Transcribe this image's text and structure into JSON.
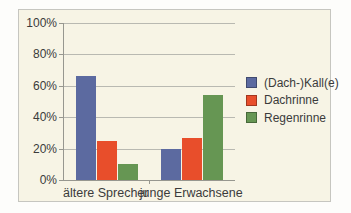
{
  "chart_data": {
    "type": "bar",
    "title": "",
    "xlabel": "",
    "ylabel": "",
    "categories": [
      "ältere Sprecher",
      "junge Erwachsene"
    ],
    "series": [
      {
        "name": "(Dach-)Kall(e)",
        "color": "#5c6aa0",
        "values": [
          66,
          20
        ]
      },
      {
        "name": "Dachrinne",
        "color": "#e84e2b",
        "values": [
          25,
          27
        ]
      },
      {
        "name": "Regenrinne",
        "color": "#669653",
        "values": [
          10,
          54
        ]
      }
    ],
    "y_ticks": [
      "0%",
      "20%",
      "40%",
      "60%",
      "80%",
      "100%"
    ],
    "ylim": [
      0,
      100
    ],
    "grid": true,
    "legend_position": "right",
    "colors": {
      "plot_background": "#f7f4e5",
      "frame_border": "#c6c6c0",
      "gridline": "#b9b9b1",
      "axis": "#97978f",
      "text": "#3b3b3b"
    }
  }
}
